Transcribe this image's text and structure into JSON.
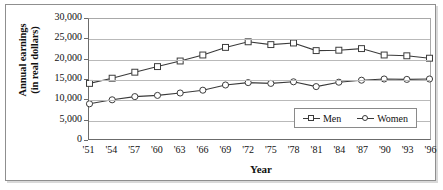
{
  "chart_data": {
    "type": "line",
    "title": "",
    "xlabel": "Year",
    "ylabel": "Annual earnings (in real dollars)",
    "ylabel_line1": "Annual earnings",
    "ylabel_line2": "(in real dollars)",
    "grid": true,
    "legend_position": "inside-bottom-right",
    "ylim": [
      0,
      30000
    ],
    "yticks": [
      0,
      5000,
      10000,
      15000,
      20000,
      25000,
      30000
    ],
    "ytick_labels": [
      "0",
      "5,000",
      "10,000",
      "15,000",
      "20,000",
      "25,000",
      "30,000"
    ],
    "categories": [
      "'51",
      "'54",
      "'57",
      "'60",
      "'63",
      "'66",
      "'69",
      "'72",
      "'75",
      "'78",
      "'81",
      "'84",
      "'87",
      "'90",
      "'93",
      "'96"
    ],
    "x": [
      1951,
      1954,
      1957,
      1960,
      1963,
      1966,
      1969,
      1972,
      1975,
      1978,
      1981,
      1984,
      1987,
      1990,
      1993,
      1996
    ],
    "series": [
      {
        "name": "Men",
        "marker": "square",
        "color": "#3a3a3a",
        "values": [
          13900,
          15200,
          16700,
          18100,
          19500,
          21000,
          22900,
          24300,
          23600,
          24000,
          22100,
          22200,
          22600,
          21000,
          20800,
          20200
        ]
      },
      {
        "name": "Women",
        "marker": "circle",
        "color": "#3a3a3a",
        "values": [
          8800,
          9800,
          10600,
          10900,
          11500,
          12200,
          13500,
          14100,
          13900,
          14300,
          13100,
          14200,
          14700,
          15000,
          14900,
          15000
        ]
      }
    ]
  },
  "legend": {
    "entries": [
      {
        "label": "Men",
        "marker": "square"
      },
      {
        "label": "Women",
        "marker": "circle"
      }
    ]
  },
  "colors": {
    "line": "#3a3a3a",
    "grid": "#b9b9b9",
    "axis": "#6b6b6b",
    "frame": "#8f8f8f",
    "background": "#ffffff"
  }
}
